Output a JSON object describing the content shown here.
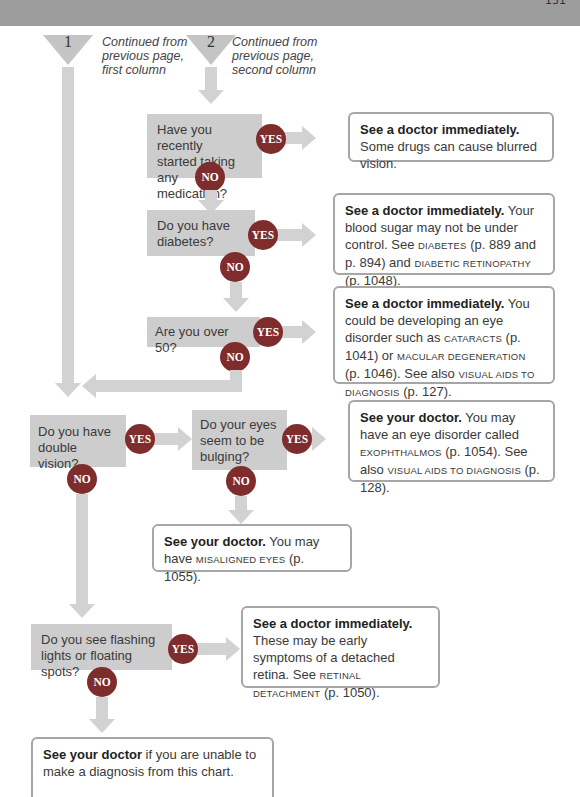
{
  "header": {
    "page_number": "131"
  },
  "connectors": [
    {
      "number": "1",
      "label_lines": [
        "Continued from",
        "previous page,",
        "first column"
      ]
    },
    {
      "number": "2",
      "label_lines": [
        "Continued from",
        "previous page,",
        "second column"
      ]
    }
  ],
  "badges": {
    "yes": "YES",
    "no": "NO"
  },
  "questions": [
    {
      "id": "medication",
      "lines": [
        "Have you recently",
        "started taking any",
        "medication?"
      ]
    },
    {
      "id": "diabetes",
      "lines": [
        "Do you have",
        "diabetes?"
      ]
    },
    {
      "id": "over50",
      "lines": [
        "Are you over 50?"
      ]
    },
    {
      "id": "double-vision",
      "lines": [
        "Do you have",
        "double vision?"
      ]
    },
    {
      "id": "bulging",
      "lines": [
        "Do your eyes",
        "seem to be",
        "bulging?"
      ]
    },
    {
      "id": "flashing",
      "lines": [
        "Do you see flashing",
        "lights or floating spots?"
      ]
    }
  ],
  "answers": [
    {
      "id": "medication",
      "bold": "See a doctor immediately.",
      "text": " Some drugs can cause blurred vision."
    },
    {
      "id": "diabetes",
      "bold": "See a doctor immediately.",
      "text1": " Your blood sugar may not be under control. See ",
      "ref1": "DIABETES",
      "text2": " (p. 889 and p. 894) and ",
      "ref2": "DIABETIC RETINOPATHY",
      "text3": " (p. 1048)."
    },
    {
      "id": "over50",
      "bold": "See a doctor immediately.",
      "text1": " You could be developing an eye disorder such as ",
      "ref1": "CATARACTS",
      "text2": " (p. 1041) or ",
      "ref2": "MACULAR DEGENERATION",
      "text3": " (p. 1046). See also ",
      "ref3": "VISUAL AIDS TO DIAGNOSIS",
      "text4": " (p. 127)."
    },
    {
      "id": "bulging",
      "bold": "See your doctor.",
      "text1": " You may have an eye disorder called ",
      "ref1": "EXOPHTHALMOS",
      "text2": " (p. 1054). See also ",
      "ref2": "VISUAL AIDS TO DIAGNOSIS",
      "text3": " (p. 128)."
    },
    {
      "id": "misaligned",
      "bold": "See your doctor.",
      "text1": " You may have ",
      "ref1": "MISALIGNED EYES",
      "text2": " (p. 1055)."
    },
    {
      "id": "flashing",
      "bold": "See a doctor immediately.",
      "text1": " These may be early symptoms of a detached retina. See ",
      "ref1": "RETINAL DETACHMENT",
      "text2": " (p. 1050)."
    },
    {
      "id": "final",
      "bold": "See your doctor",
      "text": " if you are unable to make a diagnosis from this chart."
    }
  ],
  "colors": {
    "question_bg": "#cdcdcd",
    "badge": "#7e2c2c",
    "connector": "#d2d2d2",
    "answer_border": "#a6a6a6",
    "top_bar": "#9c9c9c"
  }
}
